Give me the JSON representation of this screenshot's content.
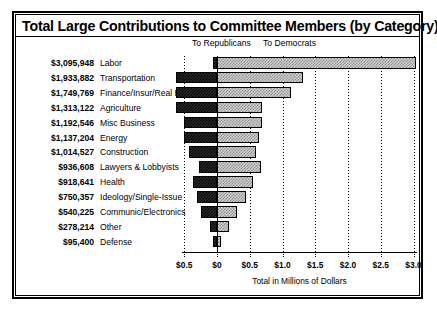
{
  "chart": {
    "title": "Total Large Contributions to Committee Members (by Category)",
    "legend": {
      "republicans": "To Republicans",
      "democrats": "To Democrats"
    },
    "xlabel": "Total in Millions of Dollars"
  },
  "chart_data": {
    "type": "bar",
    "title": "Total Large Contributions to Committee Members (by Category)",
    "subtype": "diverging-horizontal-bar",
    "xlabel": "Total in Millions of Dollars",
    "ylabel": "",
    "grid": true,
    "legend_position": "top",
    "axis_unit": "millions of dollars",
    "xlim": [
      -0.75,
      3.0
    ],
    "tick_values": [
      -0.5,
      0.0,
      0.5,
      1.0,
      1.5,
      2.0,
      2.5,
      3.0
    ],
    "tick_labels": [
      "$0.5",
      "$0",
      "$0.5",
      "$1.0",
      "$1.5",
      "$2.0",
      "$2.5",
      "$3.0"
    ],
    "categories": [
      "Labor",
      "Transportation",
      "Finance/Insur/Real Est",
      "Agriculture",
      "Misc Business",
      "Energy",
      "Construction",
      "Lawyers & Lobbyists",
      "Health",
      "Ideology/Single-Issue",
      "Communic/Electronics",
      "Other",
      "Defense"
    ],
    "totals_formatted": [
      "$3,095,948",
      "$1,933,882",
      "$1,749,769",
      "$1,313,122",
      "$1,192,546",
      "$1,137,204",
      "$1,014,527",
      "$936,608",
      "$918,641",
      "$750,357",
      "$540,225",
      "$278,214",
      "$95,400"
    ],
    "totals": [
      3095948,
      1933882,
      1749769,
      1313122,
      1192546,
      1137204,
      1014527,
      936608,
      918641,
      750357,
      540225,
      278214,
      95400
    ],
    "series": [
      {
        "name": "To Republicans",
        "color": "#1a1a1a",
        "values_millions": [
          0.06,
          0.62,
          0.62,
          0.62,
          0.5,
          0.5,
          0.42,
          0.27,
          0.37,
          0.3,
          0.24,
          0.1,
          0.04
        ]
      },
      {
        "name": "To Democrats",
        "color": "#cfcfcf",
        "values_millions": [
          3.04,
          1.31,
          1.13,
          0.69,
          0.69,
          0.64,
          0.59,
          0.67,
          0.55,
          0.45,
          0.3,
          0.18,
          0.06
        ]
      }
    ]
  },
  "rows": [
    {
      "amount": "$3,095,948",
      "category": "Labor",
      "rep": 0.06,
      "dem": 3.04
    },
    {
      "amount": "$1,933,882",
      "category": "Transportation",
      "rep": 0.62,
      "dem": 1.31
    },
    {
      "amount": "$1,749,769",
      "category": "Finance/Insur/Real Est",
      "rep": 0.62,
      "dem": 1.13
    },
    {
      "amount": "$1,313,122",
      "category": "Agriculture",
      "rep": 0.62,
      "dem": 0.69
    },
    {
      "amount": "$1,192,546",
      "category": "Misc Business",
      "rep": 0.5,
      "dem": 0.69
    },
    {
      "amount": "$1,137,204",
      "category": "Energy",
      "rep": 0.5,
      "dem": 0.64
    },
    {
      "amount": "$1,014,527",
      "category": "Construction",
      "rep": 0.42,
      "dem": 0.59
    },
    {
      "amount": "$936,608",
      "category": "Lawyers & Lobbyists",
      "rep": 0.27,
      "dem": 0.67
    },
    {
      "amount": "$918,641",
      "category": "Health",
      "rep": 0.37,
      "dem": 0.55
    },
    {
      "amount": "$750,357",
      "category": "Ideology/Single-Issue",
      "rep": 0.3,
      "dem": 0.45
    },
    {
      "amount": "$540,225",
      "category": "Communic/Electronics",
      "rep": 0.24,
      "dem": 0.3
    },
    {
      "amount": "$278,214",
      "category": "Other",
      "rep": 0.1,
      "dem": 0.18
    },
    {
      "amount": "$95,400",
      "category": "Defense",
      "rep": 0.04,
      "dem": 0.06
    }
  ]
}
